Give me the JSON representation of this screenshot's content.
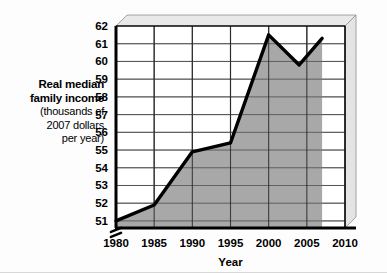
{
  "chart_data": {
    "type": "area",
    "title": "",
    "xlabel": "Year",
    "ylabel": "Real median family income (thousands of 2007 dollars per year)",
    "ylabel_lines": [
      {
        "text": "Real median",
        "weight": "bold"
      },
      {
        "text": "family income",
        "weight": "bold"
      },
      {
        "text": "(thousands of",
        "weight": "normal"
      },
      {
        "text": "2007 dollars",
        "weight": "normal"
      },
      {
        "text": "per year)",
        "weight": "normal"
      }
    ],
    "xlim": [
      1980,
      2010
    ],
    "ylim": [
      50.6,
      62
    ],
    "y_axis_break": true,
    "grid": true,
    "legend": false,
    "style_3d": true,
    "yticks": [
      51,
      52,
      53,
      54,
      55,
      56,
      57,
      58,
      59,
      60,
      61,
      62
    ],
    "ytick_labels": [
      "51",
      "52",
      "53",
      "54",
      "55",
      "56",
      "57",
      "58",
      "59",
      "60",
      "61",
      "62"
    ],
    "xticks": [
      1980,
      1985,
      1990,
      1995,
      2000,
      2005,
      2010
    ],
    "xtick_labels": [
      "1980",
      "1985",
      "1990",
      "1995",
      "2000",
      "2005",
      "2010"
    ],
    "x": [
      1980,
      1985,
      1990,
      1995,
      2000,
      2004,
      2007
    ],
    "values": [
      51.0,
      51.9,
      54.9,
      55.4,
      61.5,
      59.8,
      61.3
    ],
    "series": [
      {
        "name": "Real median family income",
        "x": [
          1980,
          1985,
          1990,
          1995,
          2000,
          2004,
          2007
        ],
        "values": [
          51.0,
          51.9,
          54.9,
          55.4,
          61.5,
          59.8,
          61.3
        ]
      }
    ],
    "colors": {
      "area_fill": "#a8a8a8",
      "line": "#000000",
      "grid": "#555555",
      "axis": "#000000",
      "panel_top": "#e9e9e9",
      "panel_side": "#e4e4e4",
      "plot_bg": "#ffffff"
    }
  }
}
